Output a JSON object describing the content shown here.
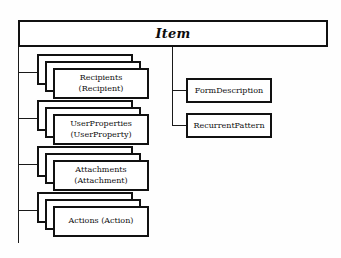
{
  "diagram": {
    "type": "uml-class-composition",
    "root": {
      "label": "Item"
    },
    "left_children": [
      {
        "line1": "Recipients",
        "line2": "(Recipient)"
      },
      {
        "line1": "UserProperties",
        "line2": "(UserProperty)"
      },
      {
        "line1": "Attachments",
        "line2": "(Attachment)"
      },
      {
        "line1": "Actions (Action)",
        "line2": ""
      }
    ],
    "right_children": [
      {
        "label": "FormDescription"
      },
      {
        "label": "RecurrentPattern"
      }
    ],
    "colors": {
      "stroke": "#111111",
      "fill": "#ffffff",
      "background": "#fefefe",
      "text": "#101010"
    }
  }
}
